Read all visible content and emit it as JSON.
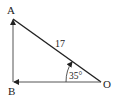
{
  "diagram": {
    "type": "right-triangle",
    "vertices": {
      "A": {
        "label": "A"
      },
      "B": {
        "label": "B"
      },
      "O": {
        "label": "O"
      }
    },
    "hypotenuse_label": "17",
    "angle_label": "35°",
    "colors": {
      "stroke": "#222222",
      "background": "#ffffff"
    }
  }
}
